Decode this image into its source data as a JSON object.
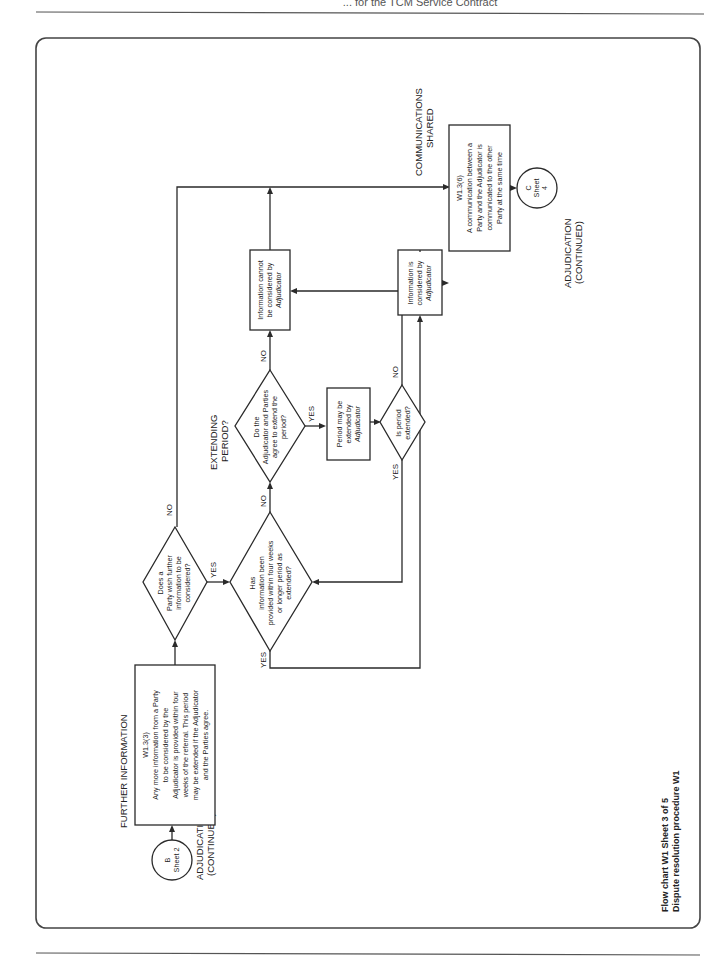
{
  "header": {
    "title": "... for the TCM Service Contract"
  },
  "footer_caption": {
    "line1": "Flow chart W1 Sheet 3 of 5",
    "line2": "Dispute resolution procedure W1"
  },
  "connectors": {
    "start": {
      "letter": "B",
      "sheet": "Sheet 2",
      "label_line1": "ADJUDICATION",
      "label_line2": "(CONTINUED)"
    },
    "end": {
      "letter": "C",
      "sheet": "Sheet",
      "sheet_num": "4",
      "label_line1": "ADJUDICATION",
      "label_line2": "(CONTINUED)"
    }
  },
  "section_labels": {
    "further_information": "FURTHER INFORMATION",
    "extending_line1": "EXTENDING",
    "extending_line2": "PERIOD?",
    "communications_line1": "COMMUNICATIONS",
    "communications_line2": "SHARED"
  },
  "boxes": {
    "w133": {
      "ref": "W1.3(3)",
      "lines": [
        "Any more information from a Party",
        "to be considered by the",
        "Adjudicator is provided within four",
        "weeks of the referral. This period",
        "may be extended if the Adjudicator",
        "and the Parties agree."
      ]
    },
    "period_extended": {
      "lines": [
        "Period may be",
        "extended by",
        "Adjudicator"
      ]
    },
    "info_cannot": {
      "lines": [
        "Information cannot",
        "be considered by",
        "Adjudicator"
      ]
    },
    "info_is": {
      "lines": [
        "Information is",
        "considered by",
        "Adjudicator"
      ]
    },
    "w136": {
      "ref": "W1.3(6)",
      "lines": [
        "A communication between a",
        "Party and the Adjudicator is",
        "communicated to the other",
        "Party at the same time"
      ]
    }
  },
  "decisions": {
    "party_wish": {
      "lines": [
        "Does a",
        "Party wish further",
        "information to be",
        "considered?"
      ]
    },
    "info_provided": {
      "lines": [
        "Has",
        "information been",
        "provided within four weeks",
        "or longer period as",
        "extended?"
      ]
    },
    "agree_extend": {
      "lines": [
        "Do the",
        "Adjudicator and Parties",
        "agree to extend the",
        "period?"
      ]
    },
    "is_extended": {
      "lines": [
        "Is period",
        "extended?"
      ]
    }
  },
  "branch_labels": {
    "yes": "YES",
    "no": "NO"
  }
}
